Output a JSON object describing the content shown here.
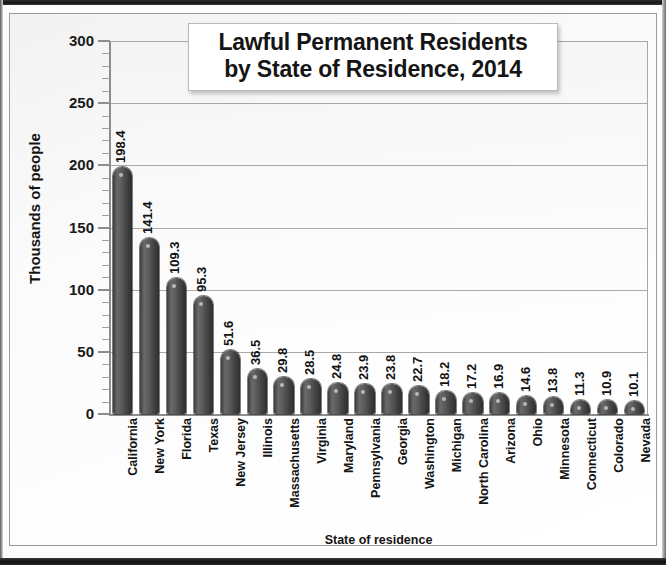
{
  "chart_data": {
    "type": "bar",
    "title": "Lawful Permanent Residents by State of Residence, 2014",
    "title_lines": [
      "Lawful Permanent Residents",
      "by State of Residence, 2014"
    ],
    "xlabel": "State of residence",
    "ylabel": "Thousands of people",
    "ylim": [
      0,
      300
    ],
    "ytick_step": 50,
    "yminor_step": 10,
    "grid": "horizontal",
    "legend": "none",
    "bar_color": "#4a4a4a",
    "categories": [
      "California",
      "New York",
      "Florida",
      "Texas",
      "New Jersey",
      "Illinois",
      "Massachusetts",
      "Virginia",
      "Maryland",
      "Pennsylvania",
      "Georgia",
      "Washington",
      "Michigan",
      "North Carolina",
      "Arizona",
      "Ohio",
      "Minnesota",
      "Connecticut",
      "Colorado",
      "Nevada"
    ],
    "values": [
      198.4,
      141.4,
      109.3,
      95.3,
      51.6,
      36.5,
      29.8,
      28.5,
      24.8,
      23.9,
      23.8,
      22.7,
      18.2,
      17.2,
      16.9,
      14.6,
      13.8,
      11.3,
      10.9,
      10.1
    ],
    "ytick_labels": [
      "0",
      "50",
      "100",
      "150",
      "200",
      "250",
      "300"
    ]
  }
}
